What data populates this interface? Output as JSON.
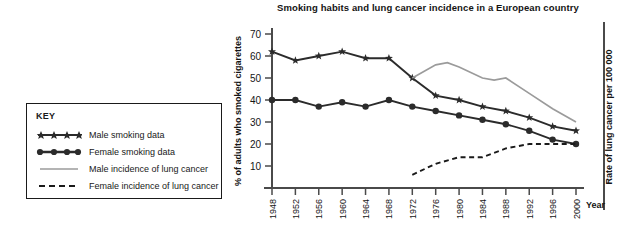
{
  "chart_data": {
    "type": "line",
    "title": "Smoking habits and lung cancer incidence in a European country",
    "xlabel": "Year",
    "ylabel": "% of adults who smoked cigarettes",
    "ylabel_right": "Rate of lung cancer per 100 000",
    "xlim": [
      1948,
      2000
    ],
    "ylim": [
      0,
      70
    ],
    "yticks": [
      10,
      20,
      30,
      40,
      50,
      60,
      70
    ],
    "xticks": [
      1948,
      1952,
      1956,
      1960,
      1964,
      1968,
      1972,
      1976,
      1980,
      1984,
      1988,
      1992,
      1996,
      2000
    ],
    "grid": false,
    "legend_position": "left-outside",
    "legend_title": "KEY",
    "series": [
      {
        "name": "Male smoking data",
        "marker": "star",
        "style": "solid",
        "color": "#2b2b2b",
        "x": [
          1948,
          1952,
          1956,
          1960,
          1964,
          1968,
          1972,
          1976,
          1980,
          1984,
          1988,
          1992,
          1996,
          2000
        ],
        "values": [
          62,
          58,
          60,
          62,
          59,
          59,
          50,
          42,
          40,
          37,
          35,
          32,
          28,
          26
        ]
      },
      {
        "name": "Female smoking data",
        "marker": "circle",
        "style": "solid",
        "color": "#2b2b2b",
        "x": [
          1948,
          1952,
          1956,
          1960,
          1964,
          1968,
          1972,
          1976,
          1980,
          1984,
          1988,
          1992,
          1996,
          2000
        ],
        "values": [
          40,
          40,
          37,
          39,
          37,
          40,
          37,
          35,
          33,
          31,
          29,
          26,
          22,
          20
        ]
      },
      {
        "name": "Male incidence of lung cancer",
        "marker": "none",
        "style": "solid-grey",
        "color": "#9b9b9b",
        "x": [
          1972,
          1976,
          1978,
          1980,
          1984,
          1986,
          1988,
          1992,
          1996,
          2000
        ],
        "values": [
          50,
          56,
          57,
          55,
          50,
          49,
          50,
          43,
          36,
          30
        ]
      },
      {
        "name": "Female incidence of lung cancer",
        "marker": "none",
        "style": "dashed",
        "color": "#1a1a1a",
        "x": [
          1972,
          1976,
          1980,
          1984,
          1988,
          1992,
          1996,
          2000
        ],
        "values": [
          6,
          11,
          14,
          14,
          18,
          20,
          20,
          20
        ]
      }
    ]
  },
  "legend": {
    "title": "KEY",
    "items": [
      {
        "label": "Male smoking data",
        "icon": "star-line-icon"
      },
      {
        "label": "Female smoking data",
        "icon": "circle-line-icon"
      },
      {
        "label": "Male incidence of lung cancer",
        "icon": "grey-line-icon"
      },
      {
        "label": "Female incidence of lung cancer",
        "icon": "dashed-line-icon"
      }
    ]
  }
}
